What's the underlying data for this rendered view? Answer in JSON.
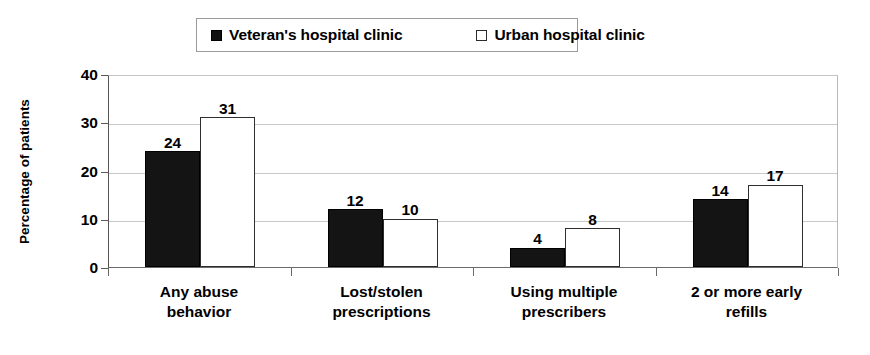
{
  "chart_data": {
    "type": "bar",
    "title": "",
    "subtitle": "",
    "xlabel": "",
    "ylabel": "Percentage of patients",
    "ylim": [
      0,
      40
    ],
    "yticks": [
      0,
      10,
      20,
      30,
      40
    ],
    "grid": true,
    "grid_axis": "y",
    "legend_position": "top-center",
    "legend": [
      "Veteran's hospital clinic",
      "Urban hospital clinic"
    ],
    "categories": [
      "Any abuse behavior",
      "Lost/stolen prescriptions",
      "Using multiple prescribers",
      "2 or more early refills"
    ],
    "category_lines": [
      [
        "Any abuse",
        "behavior"
      ],
      [
        "Lost/stolen",
        "prescriptions"
      ],
      [
        "Using multiple",
        "prescribers"
      ],
      [
        "2 or more early",
        "refills"
      ]
    ],
    "series": [
      {
        "name": "Veteran's hospital clinic",
        "color": "#141414",
        "style": "filled",
        "values": [
          24,
          12,
          4,
          14
        ]
      },
      {
        "name": "Urban hospital clinic",
        "color": "#ffffff",
        "style": "hollow",
        "values": [
          31,
          10,
          8,
          17
        ]
      }
    ],
    "data_labels": [
      {
        "category": "Any abuse behavior",
        "veterans": 24,
        "urban": 31
      },
      {
        "category": "Lost/stolen prescriptions",
        "veterans": 12,
        "urban": 10
      },
      {
        "category": "Using multiple prescribers",
        "veterans": 4,
        "urban": 8
      },
      {
        "category": "2 or more early refills",
        "veterans": 14,
        "urban": 17
      }
    ]
  },
  "axis": {
    "y_tick_0": "0",
    "y_tick_1": "10",
    "y_tick_2": "20",
    "y_tick_3": "30",
    "y_tick_4": "40",
    "y_title": "Percentage of patients"
  },
  "labels": {
    "g0_dark": "24",
    "g0_light": "31",
    "g1_dark": "12",
    "g1_light": "10",
    "g2_dark": "4",
    "g2_light": "8",
    "g3_dark": "14",
    "g3_light": "17"
  },
  "categories": {
    "c0_l1": "Any abuse",
    "c0_l2": "behavior",
    "c1_l1": "Lost/stolen",
    "c1_l2": "prescriptions",
    "c2_l1": "Using multiple",
    "c2_l2": "prescribers",
    "c3_l1": "2 or more early",
    "c3_l2": "refills"
  },
  "legend": {
    "entry0": "Veteran's hospital clinic",
    "entry1": "Urban hospital clinic"
  },
  "colors": {
    "series_veterans": "#141414",
    "series_urban": "#ffffff",
    "gridline": "#c9c9c9",
    "axis": "#5a5a5a",
    "text": "#000000"
  }
}
